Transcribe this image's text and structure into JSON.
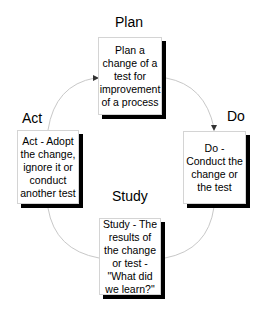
{
  "stages": {
    "plan": {
      "label": "Plan",
      "description": "Plan a change of a test for improvement of a process"
    },
    "do": {
      "label": "Do",
      "description": "Do - Conduct the change or the test"
    },
    "study": {
      "label": "Study",
      "description": "Study - The results of the change or test - \"What did we learn?\""
    },
    "act": {
      "label": "Act",
      "description": "Act - Adopt the change, ignore it or conduct another test"
    }
  },
  "colors": {
    "arc": "#c8c8c8",
    "shadow": "#000000",
    "arrow": "#333333"
  }
}
